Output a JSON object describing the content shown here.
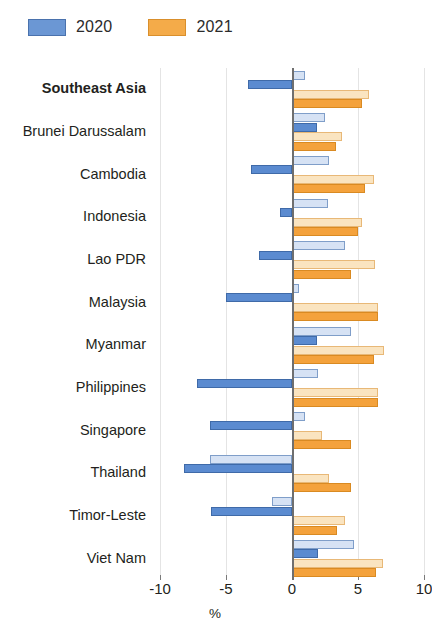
{
  "legend": {
    "position": "top-left",
    "entries": [
      {
        "label": "2020",
        "color": "#6b97d4",
        "key": "2020"
      },
      {
        "label": "2021",
        "color": "#f4ab49",
        "key": "2021"
      }
    ]
  },
  "axis": {
    "title": "%",
    "ticks": [
      "-10",
      "-5",
      "0",
      "5",
      "10"
    ],
    "tick_values": [
      -10,
      -5,
      0,
      5,
      10
    ],
    "min": -10,
    "max": 10
  },
  "chart_data": {
    "type": "bar",
    "orientation": "horizontal",
    "title": "",
    "subtitle": "",
    "xlabel": "%",
    "ylabel": "",
    "xlim": [
      -10,
      10
    ],
    "grid": true,
    "legend_position": "top-left",
    "categories": [
      "Southeast Asia",
      "Brunei Darussalam",
      "Cambodia",
      "Indonesia",
      "Lao PDR",
      "Malaysia",
      "Myanmar",
      "Philippines",
      "Singapore",
      "Thailand",
      "Timor-Leste",
      "Viet Nam"
    ],
    "emphasized_categories": [
      "Southeast Asia"
    ],
    "series": [
      {
        "name": "2020",
        "variant": "light",
        "color": "#d6e2f4",
        "values": [
          1.0,
          2.5,
          2.8,
          2.7,
          4.0,
          0.5,
          4.5,
          2.0,
          1.0,
          -6.2,
          -1.5,
          4.7
        ]
      },
      {
        "name": "2020",
        "variant": "solid",
        "color": "#5b8bd0",
        "values": [
          -3.3,
          1.9,
          -3.1,
          -0.9,
          -2.5,
          -5.0,
          1.9,
          -7.2,
          -6.2,
          -8.2,
          -6.1,
          2.0
        ]
      },
      {
        "name": "2021",
        "variant": "light",
        "color": "#fae4c0",
        "values": [
          5.8,
          3.8,
          6.2,
          5.3,
          6.3,
          6.5,
          7.0,
          6.5,
          2.3,
          2.8,
          4.0,
          6.9
        ]
      },
      {
        "name": "2021",
        "variant": "solid",
        "color": "#f4a23c",
        "values": [
          5.3,
          3.3,
          5.5,
          5.0,
          4.5,
          6.5,
          6.2,
          6.5,
          4.5,
          4.5,
          3.4,
          6.4
        ]
      }
    ]
  }
}
